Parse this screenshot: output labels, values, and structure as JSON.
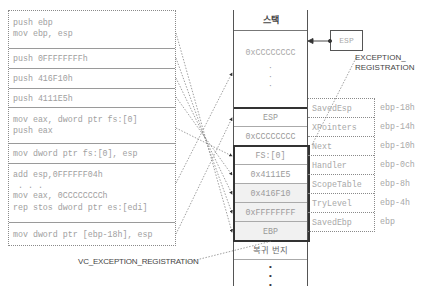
{
  "code_block": {
    "rows": [
      {
        "lines": [
          "push ebp",
          "mov ebp, esp"
        ]
      },
      {
        "lines": [
          "push 0FFFFFFFFh"
        ]
      },
      {
        "lines": [
          "push 416F10h"
        ]
      },
      {
        "lines": [
          "push 4111E5h"
        ]
      },
      {
        "lines": [
          "mov eax, dword ptr fs:[0]",
          "push eax"
        ]
      },
      {
        "lines": [
          "mov dword ptr fs:[0], esp"
        ]
      },
      {
        "lines": [
          "add esp,0FFFFFF04h",
          " . . .",
          "mov eax, 0CCCCCCCCh",
          "rep stos dword ptr es:[edi]"
        ]
      },
      {
        "lines": [
          "mov dword ptr [ebp-18h], esp"
        ]
      }
    ]
  },
  "stack": {
    "header": "스택",
    "fill_value": "0xCCCCCCCC",
    "rows": [
      {
        "value": "ESP",
        "field": "SavedEsp",
        "offset": "ebp-18h"
      },
      {
        "value": "0xCCCCCCCC",
        "field": "XPointers",
        "offset": "ebp-14h"
      },
      {
        "value": "FS:[0]",
        "field": "Next",
        "offset": "ebp-10h"
      },
      {
        "value": "0x4111E5",
        "field": "Handler",
        "offset": "ebp-0ch"
      },
      {
        "value": "0x416F10",
        "field": "ScopeTable",
        "offset": "ebp-8h"
      },
      {
        "value": "0xFFFFFFFF",
        "field": "TryLevel",
        "offset": "ebp-4h"
      },
      {
        "value": "EBP",
        "field": "SavedEbp",
        "offset": "ebp"
      },
      {
        "value": "복귀 번지",
        "field": "",
        "offset": ""
      }
    ]
  },
  "esp_pointer": {
    "label": "ESP"
  },
  "annotations": {
    "exception_registration": [
      "EXCEPTION_",
      "REGISTRATION"
    ],
    "vc_exception_registration": "VC_EXCEPTION_REGISTRATION"
  }
}
